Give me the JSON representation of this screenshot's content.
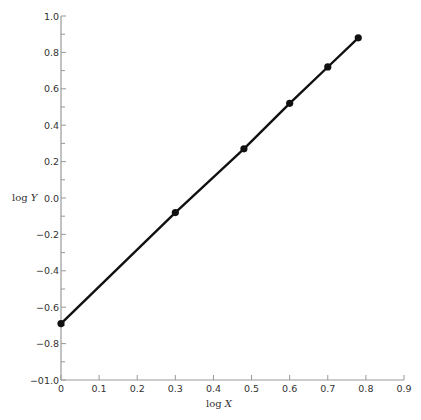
{
  "chart_data": {
    "type": "line",
    "title": "",
    "xlabel": "log X",
    "ylabel": "log Y",
    "xlim": [
      0,
      0.9
    ],
    "ylim": [
      -1.0,
      1.0
    ],
    "x_ticks": [
      "0",
      "0.1",
      "0.2",
      "0.3",
      "0.4",
      "0.5",
      "0.6",
      "0.7",
      "0.8",
      "0.9"
    ],
    "y_ticks": [
      "1.0",
      "0.8",
      "0.6",
      "0.4",
      "0.2",
      "0.0",
      "−0.2",
      "−0.4",
      "−0.6",
      "−0.8",
      "−01.0"
    ],
    "y_tick_values": [
      1.0,
      0.8,
      0.6,
      0.4,
      0.2,
      0.0,
      -0.2,
      -0.4,
      -0.6,
      -0.8,
      -1.0
    ],
    "x_tick_values": [
      0,
      0.1,
      0.2,
      0.3,
      0.4,
      0.5,
      0.6,
      0.7,
      0.8,
      0.9
    ],
    "grid": false,
    "legend": null,
    "series": [
      {
        "name": "log Y vs log X",
        "x": [
          0.0,
          0.3,
          0.48,
          0.6,
          0.7,
          0.78
        ],
        "y": [
          -0.69,
          -0.08,
          0.27,
          0.52,
          0.72,
          0.88
        ],
        "marker": "circle",
        "color": "#111111"
      }
    ]
  },
  "axes": {
    "x_title_main": "log ",
    "x_title_var": "X",
    "y_title_main": "log ",
    "y_title_var": "Y",
    "axis_color": "#999999",
    "line_color": "#111111"
  }
}
